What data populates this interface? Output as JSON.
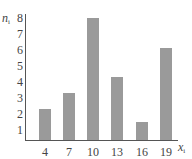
{
  "chart_data": {
    "type": "bar",
    "title": "",
    "xlabel": "x_i",
    "ylabel": "n_i",
    "categories": [
      "4",
      "7",
      "10",
      "13",
      "16",
      "19"
    ],
    "values": [
      2.3,
      3.3,
      8.0,
      4.3,
      1.5,
      6.1
    ],
    "yticks": [
      "1",
      "2",
      "3",
      "4",
      "5",
      "6",
      "7",
      "8"
    ],
    "ylim": [
      0,
      8
    ],
    "grid": false,
    "legend": null,
    "bar_color": "#9a9a9a"
  },
  "labels": {
    "y_main": "n",
    "y_sub": "i",
    "x_main": "x",
    "x_sub": "i"
  }
}
